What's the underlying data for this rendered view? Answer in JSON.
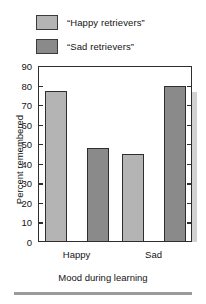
{
  "chart_data": {
    "type": "bar",
    "title": "",
    "subtitle": "",
    "xlabel": "Mood during learning",
    "ylabel": "Percent remembered",
    "categories": [
      "Happy",
      "Sad"
    ],
    "series": [
      {
        "name": "“Happy retrievers”",
        "values": [
          77,
          45
        ],
        "color": "#b4b4b4"
      },
      {
        "name": "“Sad retrievers”",
        "values": [
          48,
          80
        ],
        "color": "#8a8a8a"
      }
    ],
    "ylim": [
      0,
      90
    ],
    "ytick_step": 10,
    "yticks": [
      0,
      10,
      20,
      30,
      40,
      50,
      60,
      70,
      80,
      90
    ],
    "ytick_labels": [
      "0",
      "10",
      "20",
      "30",
      "40",
      "50",
      "60",
      "70",
      "80",
      "90"
    ],
    "grid": false,
    "ticks_both_sides": true,
    "legend_position": "top",
    "bar_style": "3d-shadow"
  },
  "legend": {
    "items": [
      {
        "label": "“Happy retrievers”",
        "swatch": "light"
      },
      {
        "label": "“Sad retrievers”",
        "swatch": "dark"
      }
    ]
  },
  "axes": {
    "y_title": "Percent remembered",
    "x_title": "Mood during learning",
    "x_tick_labels": [
      "Happy",
      "Sad"
    ]
  }
}
